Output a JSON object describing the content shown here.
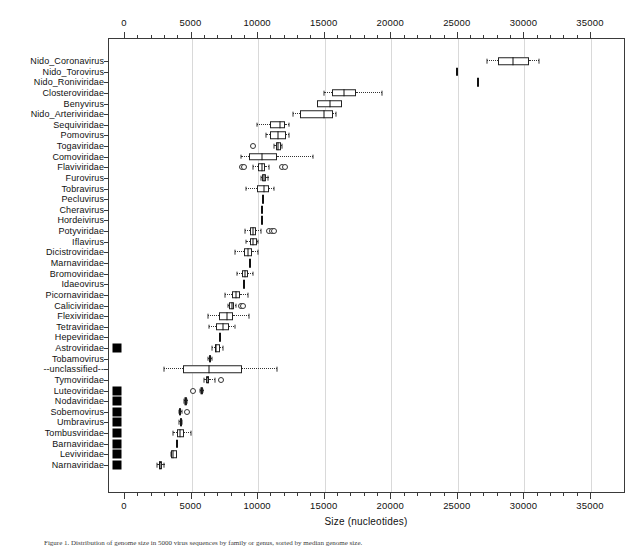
{
  "figure": {
    "xlabel": "Size (nucleotides)",
    "caption": "Figure 1. Distribution of genome size in 5000 virus sequences by family or genus, sorted by median genome size."
  },
  "chart_data": {
    "type": "box",
    "title": "",
    "xlabel": "Size (nucleotides)",
    "ylabel": "",
    "xlim": [
      -1000,
      36000
    ],
    "xticks": [
      0,
      5000,
      10000,
      15000,
      20000,
      25000,
      30000,
      35000
    ],
    "xticklabels": [
      "0",
      "5000",
      "10000",
      "15000",
      "20000",
      "25000",
      "30000",
      "35000"
    ],
    "minor_tick_interval": 1000,
    "grid": "vertical-dotted",
    "axis_top": true,
    "axis_bottom": true,
    "host_marker_legend": "filled black square",
    "categories": [
      {
        "label": "Nido_Coronavirus",
        "host_marker": false,
        "whisker_low": 27300,
        "q1": 28100,
        "median": 29200,
        "q3": 30400,
        "whisker_high": 31200,
        "outliers": []
      },
      {
        "label": "Nido_Torovirus",
        "host_marker": false,
        "whisker_low": 25000,
        "q1": 25000,
        "median": 25000,
        "q3": 25000,
        "whisker_high": 25000,
        "outliers": []
      },
      {
        "label": "Nido_Roniviridae",
        "host_marker": false,
        "whisker_low": 26600,
        "q1": 26600,
        "median": 26600,
        "q3": 26600,
        "whisker_high": 26600,
        "outliers": []
      },
      {
        "label": "Closteroviridae",
        "host_marker": false,
        "whisker_low": 15000,
        "q1": 15600,
        "median": 16500,
        "q3": 17400,
        "whisker_high": 19400,
        "outliers": []
      },
      {
        "label": "Benyvirus",
        "host_marker": false,
        "whisker_low": 14500,
        "q1": 14500,
        "median": 15500,
        "q3": 16400,
        "whisker_high": 16400,
        "outliers": []
      },
      {
        "label": "Nido_Arteriviridae",
        "host_marker": false,
        "whisker_low": 12700,
        "q1": 13200,
        "median": 15000,
        "q3": 15700,
        "whisker_high": 15900,
        "outliers": []
      },
      {
        "label": "Sequiviridae",
        "host_marker": false,
        "whisker_low": 10000,
        "q1": 11000,
        "median": 11700,
        "q3": 12100,
        "whisker_high": 12400,
        "outliers": []
      },
      {
        "label": "Pomovirus",
        "host_marker": false,
        "whisker_low": 10700,
        "q1": 11000,
        "median": 11600,
        "q3": 12200,
        "whisker_high": 12400,
        "outliers": []
      },
      {
        "label": "Togaviridae",
        "host_marker": false,
        "whisker_low": 11300,
        "q1": 11400,
        "median": 11600,
        "q3": 11800,
        "whisker_high": 11900,
        "outliers": [
          9700
        ]
      },
      {
        "label": "Comoviridae",
        "host_marker": false,
        "whisker_low": 8800,
        "q1": 9400,
        "median": 10400,
        "q3": 11500,
        "whisker_high": 14200,
        "outliers": []
      },
      {
        "label": "Flaviviridae",
        "host_marker": false,
        "whisker_low": 9700,
        "q1": 10100,
        "median": 10400,
        "q3": 10600,
        "whisker_high": 10900,
        "outliers": [
          8900,
          9050,
          11900,
          12100
        ]
      },
      {
        "label": "Furovirus",
        "host_marker": false,
        "whisker_low": 10300,
        "q1": 10400,
        "median": 10550,
        "q3": 10700,
        "whisker_high": 10800,
        "outliers": []
      },
      {
        "label": "Tobravirus",
        "host_marker": false,
        "whisker_low": 9200,
        "q1": 10000,
        "median": 10500,
        "q3": 10900,
        "whisker_high": 11300,
        "outliers": []
      },
      {
        "label": "Pecluvirus",
        "host_marker": false,
        "whisker_low": 10450,
        "q1": 10450,
        "median": 10450,
        "q3": 10450,
        "whisker_high": 10450,
        "outliers": []
      },
      {
        "label": "Cheravirus",
        "host_marker": false,
        "whisker_low": 10400,
        "q1": 10400,
        "median": 10400,
        "q3": 10400,
        "whisker_high": 10400,
        "outliers": []
      },
      {
        "label": "Hordeivirus",
        "host_marker": false,
        "whisker_low": 10400,
        "q1": 10400,
        "median": 10400,
        "q3": 10400,
        "whisker_high": 10400,
        "outliers": []
      },
      {
        "label": "Potyviridae",
        "host_marker": false,
        "whisker_low": 9100,
        "q1": 9500,
        "median": 9700,
        "q3": 9900,
        "whisker_high": 10300,
        "outliers": [
          10900,
          11100,
          11300
        ]
      },
      {
        "label": "Iflavirus",
        "host_marker": false,
        "whisker_low": 9200,
        "q1": 9500,
        "median": 9700,
        "q3": 10000,
        "whisker_high": 10100,
        "outliers": []
      },
      {
        "label": "Dicistroviridae",
        "host_marker": false,
        "whisker_low": 8300,
        "q1": 9000,
        "median": 9300,
        "q3": 9600,
        "whisker_high": 10100,
        "outliers": []
      },
      {
        "label": "Marnaviridae",
        "host_marker": false,
        "whisker_low": 9500,
        "q1": 9500,
        "median": 9500,
        "q3": 9500,
        "whisker_high": 9500,
        "outliers": []
      },
      {
        "label": "Bromoviridae",
        "host_marker": false,
        "whisker_low": 8500,
        "q1": 8900,
        "median": 9100,
        "q3": 9300,
        "whisker_high": 9700,
        "outliers": []
      },
      {
        "label": "Idaeovirus",
        "host_marker": false,
        "whisker_low": 9000,
        "q1": 9000,
        "median": 9000,
        "q3": 9000,
        "whisker_high": 9000,
        "outliers": []
      },
      {
        "label": "Picornaviridae",
        "host_marker": false,
        "whisker_low": 7600,
        "q1": 8100,
        "median": 8400,
        "q3": 8700,
        "whisker_high": 9300,
        "outliers": []
      },
      {
        "label": "Caliciviridae",
        "host_marker": false,
        "whisker_low": 7800,
        "q1": 7900,
        "median": 8100,
        "q3": 8300,
        "whisker_high": 8400,
        "outliers": [
          8800,
          8950
        ]
      },
      {
        "label": "Flexiviridae",
        "host_marker": false,
        "whisker_low": 6300,
        "q1": 7100,
        "median": 7700,
        "q3": 8200,
        "whisker_high": 9400,
        "outliers": []
      },
      {
        "label": "Tetraviridae",
        "host_marker": false,
        "whisker_low": 6400,
        "q1": 6900,
        "median": 7400,
        "q3": 7900,
        "whisker_high": 8300,
        "outliers": []
      },
      {
        "label": "Hepeviridae",
        "host_marker": false,
        "whisker_low": 7200,
        "q1": 7200,
        "median": 7200,
        "q3": 7200,
        "whisker_high": 7200,
        "outliers": []
      },
      {
        "label": "Astroviridae",
        "host_marker": true,
        "whisker_low": 6600,
        "q1": 6800,
        "median": 6900,
        "q3": 7200,
        "whisker_high": 7400,
        "outliers": []
      },
      {
        "label": "Tobamovirus",
        "host_marker": false,
        "whisker_low": 6300,
        "q1": 6350,
        "median": 6450,
        "q3": 6550,
        "whisker_high": 6600,
        "outliers": []
      },
      {
        "label": "--unclassified--",
        "host_marker": false,
        "whisker_low": 3000,
        "q1": 4400,
        "median": 6400,
        "q3": 8900,
        "whisker_high": 11500,
        "outliers": []
      },
      {
        "label": "Tymoviridae",
        "host_marker": false,
        "whisker_low": 6000,
        "q1": 6150,
        "median": 6300,
        "q3": 6400,
        "whisker_high": 6800,
        "outliers": [
          7300
        ]
      },
      {
        "label": "Luteoviridae",
        "host_marker": true,
        "whisker_low": 5700,
        "q1": 5750,
        "median": 5800,
        "q3": 5900,
        "whisker_high": 5950,
        "outliers": [
          5200
        ]
      },
      {
        "label": "Nodaviridae",
        "host_marker": true,
        "whisker_low": 4500,
        "q1": 4550,
        "median": 4600,
        "q3": 4700,
        "whisker_high": 4750,
        "outliers": []
      },
      {
        "label": "Sobemovirus",
        "host_marker": true,
        "whisker_low": 4100,
        "q1": 4150,
        "median": 4200,
        "q3": 4300,
        "whisker_high": 4350,
        "outliers": [
          4700
        ]
      },
      {
        "label": "Umbravirus",
        "host_marker": true,
        "whisker_low": 4150,
        "q1": 4200,
        "median": 4250,
        "q3": 4300,
        "whisker_high": 4350,
        "outliers": []
      },
      {
        "label": "Tombusviridae",
        "host_marker": true,
        "whisker_low": 3700,
        "q1": 4000,
        "median": 4200,
        "q3": 4500,
        "whisker_high": 5000,
        "outliers": []
      },
      {
        "label": "Barnaviridae",
        "host_marker": true,
        "whisker_low": 4000,
        "q1": 4000,
        "median": 4000,
        "q3": 4000,
        "whisker_high": 4000,
        "outliers": []
      },
      {
        "label": "Leviviridae",
        "host_marker": true,
        "whisker_low": 3500,
        "q1": 3550,
        "median": 3700,
        "q3": 3950,
        "whisker_high": 3950,
        "outliers": []
      },
      {
        "label": "Narnaviridae",
        "host_marker": true,
        "whisker_low": 2500,
        "q1": 2600,
        "median": 2700,
        "q3": 2850,
        "whisker_high": 3000,
        "outliers": []
      }
    ]
  }
}
